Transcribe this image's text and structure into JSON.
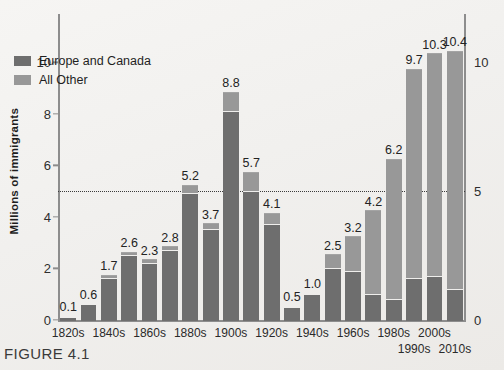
{
  "figure": {
    "caption": "FIGURE 4.1"
  },
  "legend": {
    "items": [
      {
        "label": "Europe and Canada",
        "color": "#6e6e6e",
        "swatch_name": "legend-swatch-europe-canada"
      },
      {
        "label": "All Other",
        "color": "#989898",
        "swatch_name": "legend-swatch-all-other"
      }
    ]
  },
  "chart_data": {
    "type": "bar",
    "title": "",
    "subtitle": "",
    "xlabel": "",
    "ylabel": "Millions of immigrants",
    "ylim": [
      0,
      11.8
    ],
    "yticks": [
      0,
      2,
      4,
      6,
      8,
      10
    ],
    "ytick_labels": [
      "0",
      "2",
      "4",
      "6",
      "8",
      "10"
    ],
    "right_axis_ticks": [
      0,
      5,
      10
    ],
    "right_axis_tick_labels": [
      "0",
      "5",
      "10"
    ],
    "grid": false,
    "reference_line": {
      "value": 5,
      "style": "dotted",
      "color": "#3b3b3b"
    },
    "legend_position": "inside top-left",
    "stacked": true,
    "categories": [
      "1820s",
      "1830s",
      "1840s",
      "1850s",
      "1860s",
      "1870s",
      "1880s",
      "1890s",
      "1900s",
      "1910s",
      "1920s",
      "1930s",
      "1940s",
      "1950s",
      "1960s",
      "1970s",
      "1980s",
      "1990s",
      "2000s",
      "2010s"
    ],
    "category_tick_labels": [
      {
        "label": "1820s",
        "index": 0,
        "row": 1
      },
      {
        "label": "1840s",
        "index": 2,
        "row": 1
      },
      {
        "label": "1860s",
        "index": 4,
        "row": 1
      },
      {
        "label": "1880s",
        "index": 6,
        "row": 1
      },
      {
        "label": "1900s",
        "index": 8,
        "row": 1
      },
      {
        "label": "1920s",
        "index": 10,
        "row": 1
      },
      {
        "label": "1940s",
        "index": 12,
        "row": 1
      },
      {
        "label": "1960s",
        "index": 14,
        "row": 1
      },
      {
        "label": "1980s",
        "index": 16,
        "row": 1
      },
      {
        "label": "1990s",
        "index": 17,
        "row": 2
      },
      {
        "label": "2000s",
        "index": 18,
        "row": 1
      },
      {
        "label": "2010s",
        "index": 19,
        "row": 2
      }
    ],
    "totals": [
      0.1,
      0.6,
      1.7,
      2.6,
      2.3,
      2.8,
      5.2,
      3.7,
      8.8,
      5.7,
      4.1,
      0.5,
      1.0,
      2.5,
      3.2,
      4.2,
      6.2,
      9.7,
      10.3,
      10.4
    ],
    "total_labels": [
      "0.1",
      "0.6",
      "1.7",
      "2.6",
      "2.3",
      "2.8",
      "5.2",
      "3.7",
      "8.8",
      "5.7",
      "4.1",
      "0.5",
      "1.0",
      "2.5",
      "3.2",
      "4.2",
      "6.2",
      "9.7",
      "10.3",
      "10.4"
    ],
    "series": [
      {
        "name": "Europe and Canada",
        "color": "#6e6e6e",
        "values": [
          0.1,
          0.6,
          1.6,
          2.5,
          2.2,
          2.7,
          4.9,
          3.5,
          8.1,
          5.0,
          3.7,
          0.5,
          1.0,
          2.0,
          1.9,
          1.0,
          0.8,
          1.6,
          1.7,
          1.2
        ]
      },
      {
        "name": "All Other",
        "color": "#989898",
        "values": [
          0.0,
          0.0,
          0.1,
          0.1,
          0.1,
          0.1,
          0.3,
          0.2,
          0.7,
          0.7,
          0.4,
          0.0,
          0.0,
          0.5,
          1.3,
          3.2,
          5.4,
          8.1,
          8.6,
          9.2
        ]
      }
    ]
  }
}
